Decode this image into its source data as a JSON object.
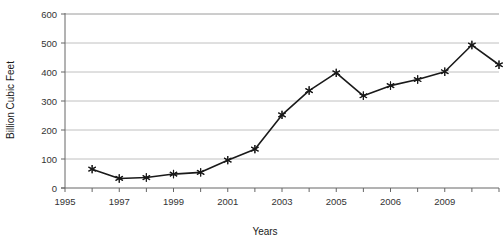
{
  "chart_data": {
    "type": "line",
    "title": "",
    "subtitle": "",
    "xlabel": "Years",
    "ylabel": "Billion Cubic Feet",
    "xlim": [
      1995,
      2011
    ],
    "ylim": [
      0,
      600
    ],
    "grid": true,
    "legend": false,
    "legend_position": "none",
    "marker": "asterisk-star",
    "line_color": "#1a1a1a",
    "grid_color": "#b0b0b0",
    "axis_color": "#808080",
    "x": [
      1996,
      1997,
      1998,
      1999,
      2000,
      2001,
      2002,
      2003,
      2004,
      2005,
      2006,
      2007,
      2008,
      2009,
      2010,
      2011
    ],
    "values": [
      65,
      33,
      36,
      48,
      54,
      96,
      134,
      252,
      336,
      397,
      318,
      353,
      374,
      401,
      493,
      425
    ],
    "x_tick_positions": [
      1995,
      1996,
      1997,
      1998,
      1999,
      2000,
      2001,
      2002,
      2003,
      2004,
      2005,
      2006,
      2007,
      2008,
      2009,
      2010,
      2011
    ],
    "x_tick_labels": [
      "1995",
      "",
      "1997",
      "",
      "1999",
      "",
      "2001",
      "",
      "2003",
      "",
      "2005",
      "",
      "2006",
      "",
      "2009",
      "",
      ""
    ],
    "x_labeled_ticks": [
      {
        "value": 1995,
        "label": "1995"
      },
      {
        "value": 1997,
        "label": "1997"
      },
      {
        "value": 1999,
        "label": "1999"
      },
      {
        "value": 2001,
        "label": "2001"
      },
      {
        "value": 2003,
        "label": "2003"
      },
      {
        "value": 2005,
        "label": "2005"
      },
      {
        "value": 2007,
        "label": "2006"
      },
      {
        "value": 2009,
        "label": "2009"
      }
    ],
    "y_ticks": [
      0,
      100,
      200,
      300,
      400,
      500,
      600
    ],
    "y_tick_labels": [
      "0",
      "100",
      "200",
      "300",
      "400",
      "500",
      "600"
    ]
  }
}
